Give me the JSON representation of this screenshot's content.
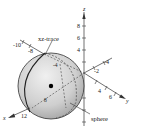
{
  "figure": {
    "type": "3d-sphere-diagram",
    "callouts": {
      "xz_trace": "xz-trace",
      "sphere": "sphere"
    },
    "axes": {
      "x": {
        "label": "x",
        "ticks": [
          "-10",
          "-8",
          "-4",
          "8",
          "12"
        ]
      },
      "y": {
        "label": "y",
        "ticks": [
          "-4",
          "-2",
          "4",
          "6"
        ]
      },
      "z": {
        "label": "z",
        "ticks": [
          "8",
          "6",
          "4"
        ]
      }
    },
    "colors": {
      "sphere_fill": "#c8c8c8",
      "sphere_highlight": "#ececec",
      "line": "#333333",
      "center_dot": "#000000"
    }
  }
}
